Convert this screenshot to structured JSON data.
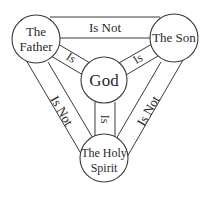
{
  "diagram": {
    "colors": {
      "line": "#3a3a3a",
      "text": "#2a2a2a",
      "background": "#ffffff"
    },
    "nodes": {
      "father": {
        "line1": "The",
        "line2": "Father"
      },
      "son": {
        "label": "The Son"
      },
      "god": {
        "label": "God"
      },
      "spirit": {
        "line1": "The Holy",
        "line2": "Spirit"
      }
    },
    "edges": {
      "father_son": "Is Not",
      "father_god": "Is",
      "son_god": "Is",
      "god_spirit": "Is",
      "father_spirit": "Is Not",
      "son_spirit": "Is Not"
    }
  }
}
